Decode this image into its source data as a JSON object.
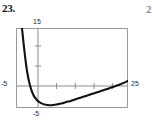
{
  "problem": {
    "number": "23.",
    "next_number_partial": "2"
  },
  "figure": {
    "frame_color": "#9a9a9a",
    "axis_color": "#8a8a8a",
    "curve_color": "#111111"
  },
  "chart_data": {
    "type": "line",
    "title": "",
    "xlabel": "",
    "ylabel": "",
    "grid": false,
    "legend": null,
    "xlim": [
      -5,
      25
    ],
    "ylim": [
      -5,
      15
    ],
    "axis_tick_labels": {
      "y_top": "15",
      "y_bottom": "-5",
      "x_left": "-5",
      "x_right": "25"
    },
    "x_ticks": [
      5,
      10,
      15,
      20
    ],
    "y_ticks": [
      5,
      10
    ],
    "series": [
      {
        "name": "curve",
        "x": [
          -3.4,
          -3.2,
          -3.0,
          -2.8,
          -2.6,
          -2.4,
          -2.2,
          -2.0,
          -1.6,
          -1.2,
          -0.8,
          -0.4,
          0.0,
          0.6,
          1.2,
          2.0,
          3.0,
          4.0,
          5.0,
          6.0,
          7.0,
          8.0,
          9.0,
          10.0,
          11.5,
          13.0,
          14.5,
          16.0,
          17.5,
          19.0,
          20.5,
          22.0,
          23.0,
          24.0,
          25.0
        ],
        "y": [
          15.0,
          13.2,
          11.4,
          9.7,
          8.1,
          6.6,
          5.2,
          4.0,
          2.0,
          0.5,
          -0.7,
          -1.6,
          -2.3,
          -3.0,
          -3.5,
          -3.9,
          -4.2,
          -4.3,
          -4.25,
          -4.1,
          -3.9,
          -3.65,
          -3.4,
          -3.1,
          -2.65,
          -2.2,
          -1.75,
          -1.3,
          -0.85,
          -0.4,
          0.1,
          0.6,
          0.95,
          1.35,
          1.8
        ]
      }
    ]
  }
}
